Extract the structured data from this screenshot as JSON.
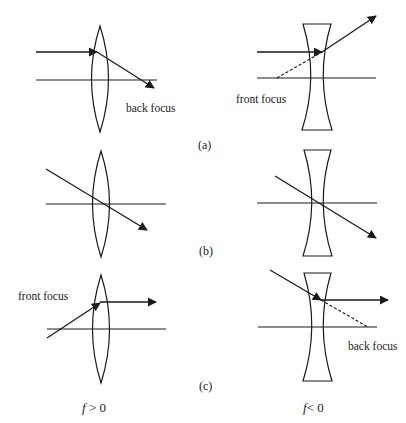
{
  "diagram": {
    "panels": [
      {
        "id": "a",
        "caption": "(a)"
      },
      {
        "id": "b",
        "caption": "(b)"
      },
      {
        "id": "c",
        "caption": "(c)"
      }
    ],
    "columns": [
      {
        "lens": "converging",
        "label_f": "f",
        "label_rel": " > 0"
      },
      {
        "lens": "diverging",
        "label_f": "f",
        "label_rel": "< 0"
      }
    ],
    "labels": {
      "a_left": "back focus",
      "a_right": "front focus",
      "c_left": "front focus",
      "c_right": "back focus"
    },
    "colors": {
      "line": "#1a1a1a",
      "background": "#ffffff"
    }
  }
}
